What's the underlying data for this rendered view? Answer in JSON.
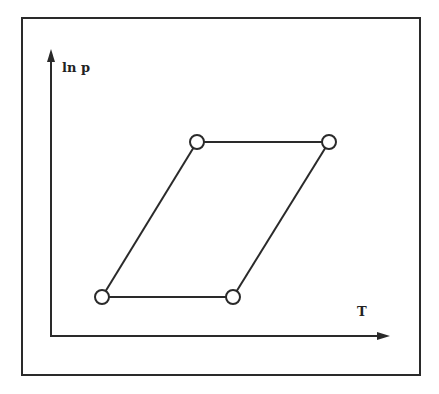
{
  "diagram": {
    "y_axis_label": "ln p",
    "x_axis_label": "T",
    "line_color": "#2a2a2a",
    "background": "#ffffff",
    "cycle_points": [
      {
        "name": "bottom-left",
        "x": 102,
        "y": 297
      },
      {
        "name": "bottom-right",
        "x": 233,
        "y": 297
      },
      {
        "name": "top-right",
        "x": 329,
        "y": 142
      },
      {
        "name": "top-left",
        "x": 197,
        "y": 142
      }
    ]
  }
}
